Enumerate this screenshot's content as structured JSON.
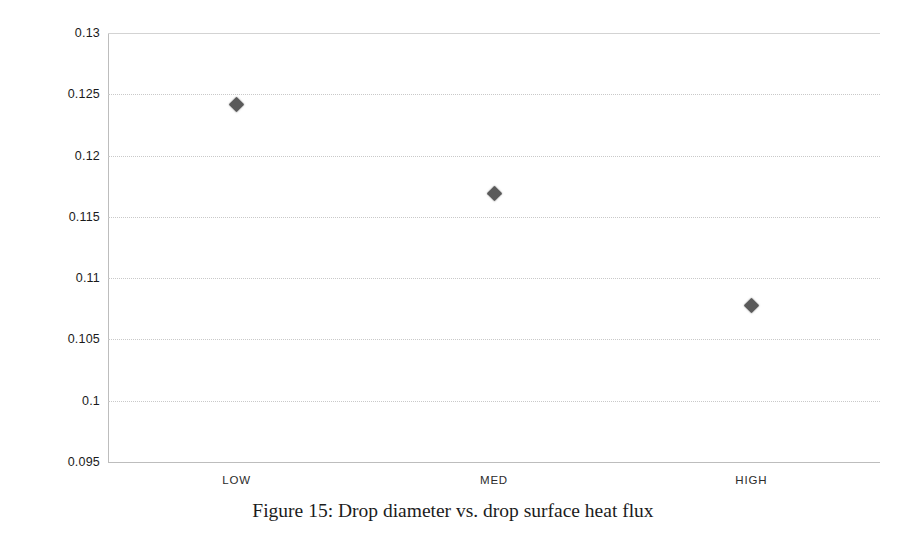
{
  "chart_data": {
    "type": "scatter",
    "title": "",
    "subtitle": "",
    "xlabel": "",
    "ylabel": "Bead Diameter (in)",
    "categories": [
      "LOW",
      "MED",
      "HIGH"
    ],
    "values": [
      0.1242,
      0.1169,
      0.1078
    ],
    "series": [
      {
        "name": "Bead Diameter",
        "values": [
          0.1242,
          0.1169,
          0.1078
        ],
        "marker": "diamond",
        "color": "#5a5a5a"
      }
    ],
    "ylim": [
      0.095,
      0.13
    ],
    "ytick_values": [
      0.13,
      0.125,
      0.12,
      0.115,
      0.11,
      0.105,
      0.1,
      0.095
    ],
    "ytick_labels": [
      "0.13",
      "0.125",
      "0.12",
      "0.115",
      "0.11",
      "0.105",
      "0.1",
      "0.095"
    ],
    "xtick_labels": [
      "LOW",
      "MED",
      "HIGH"
    ],
    "grid": "horizontal-dotted",
    "legend": "none",
    "gridline_color": "#c9c9c9",
    "axis_color": "#bdbdbd",
    "background": "#ffffff"
  },
  "caption": {
    "text": "Figure 15: Drop diameter vs. drop surface heat flux"
  }
}
